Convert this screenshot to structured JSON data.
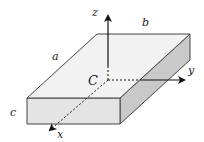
{
  "figure": {
    "type": "3d-rectangular-block-with-axes",
    "labels": {
      "a": "a",
      "b": "b",
      "c": "c",
      "center": "C",
      "x_axis": "x",
      "y_axis": "y",
      "z_axis": "z"
    },
    "colors": {
      "top_face": "#f2f2f2",
      "front_face": "#e4e4e4",
      "side_face": "#c9c9c9",
      "edge": "#444444",
      "axis": "#111111"
    }
  }
}
